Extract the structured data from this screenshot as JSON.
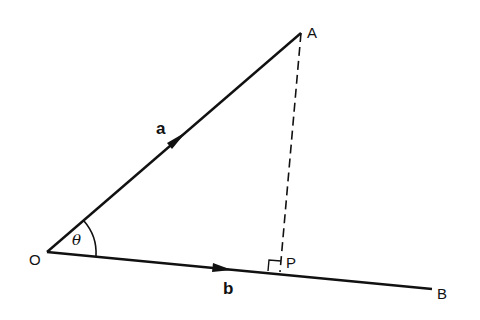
{
  "diagram": {
    "type": "vector-projection",
    "points": {
      "O": {
        "label": "O",
        "x": 47,
        "y": 252
      },
      "A": {
        "label": "A",
        "x": 301,
        "y": 33
      },
      "P": {
        "label": "P",
        "x": 280,
        "y": 272
      },
      "B": {
        "label": "B",
        "x": 432,
        "y": 289
      }
    },
    "vectors": {
      "a": {
        "label": "a",
        "from": "O",
        "to": "A"
      },
      "b": {
        "label": "b",
        "from": "O",
        "to": "B"
      }
    },
    "angle": {
      "label": "θ",
      "between": [
        "a",
        "b"
      ],
      "vertex": "O"
    },
    "perpendicular": {
      "from": "A",
      "to": "P",
      "style": "dashed",
      "right_angle_marker": true
    }
  }
}
